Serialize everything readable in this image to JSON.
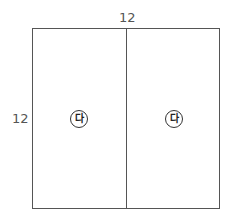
{
  "diagram": {
    "dimensions": {
      "width_label": "12",
      "height_label": "12"
    },
    "regions": [
      {
        "label": "다"
      },
      {
        "label": "다"
      }
    ],
    "colors": {
      "line": "#555555",
      "text": "#555555",
      "background": "#ffffff"
    }
  }
}
